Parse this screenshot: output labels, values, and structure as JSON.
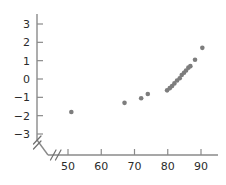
{
  "chart_data": {
    "type": "scatter",
    "title": "",
    "subtitle": "",
    "xlabel": "",
    "ylabel": "",
    "xlim": [
      46,
      94
    ],
    "ylim": [
      -3.4,
      3.4
    ],
    "grid": false,
    "legend": null,
    "axis_break": {
      "x_axis": true,
      "y_axis": true,
      "note": "double-slash break marks near the origin on both axes"
    },
    "xticks": [
      50,
      60,
      70,
      80,
      90
    ],
    "xtick_labels": [
      "50",
      "60",
      "70",
      "80",
      "90"
    ],
    "yticks": [
      -3,
      -2,
      -1,
      0,
      1,
      2,
      3
    ],
    "ytick_labels": [
      "−3",
      "−2",
      "−1",
      "0",
      "1",
      "2",
      "3"
    ],
    "marker": {
      "shape": "circle",
      "color": "#7d7d7d",
      "size_px": 4.6
    },
    "points": [
      {
        "x": 51.0,
        "y": -1.8
      },
      {
        "x": 67.0,
        "y": -1.3
      },
      {
        "x": 72.0,
        "y": -1.05
      },
      {
        "x": 74.0,
        "y": -0.82
      },
      {
        "x": 79.8,
        "y": -0.62
      },
      {
        "x": 80.6,
        "y": -0.5
      },
      {
        "x": 81.3,
        "y": -0.38
      },
      {
        "x": 82.0,
        "y": -0.24
      },
      {
        "x": 82.8,
        "y": -0.08
      },
      {
        "x": 83.6,
        "y": 0.04
      },
      {
        "x": 84.2,
        "y": 0.22
      },
      {
        "x": 84.9,
        "y": 0.34
      },
      {
        "x": 85.5,
        "y": 0.46
      },
      {
        "x": 86.2,
        "y": 0.62
      },
      {
        "x": 86.8,
        "y": 0.7
      },
      {
        "x": 88.2,
        "y": 1.05
      },
      {
        "x": 90.4,
        "y": 1.7
      }
    ]
  },
  "colors": {
    "marker": "#7d7d7d",
    "axis": "#8a8a8a",
    "tick_text": "#2b2b2b",
    "background": "#ffffff"
  }
}
